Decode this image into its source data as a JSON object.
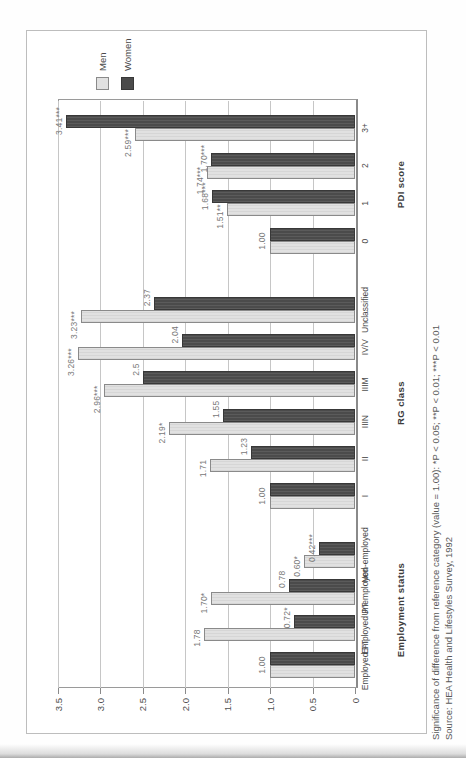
{
  "chart_data": {
    "type": "bar",
    "orientation": "vertical-bars",
    "page_rotation_deg": -90,
    "value_axis": {
      "min": 0,
      "max": 3.5,
      "gridline_step": 0.5,
      "ticks": [
        {
          "label": "3.5",
          "value": 3.5
        },
        {
          "label": "3.0",
          "value": 3.0
        },
        {
          "label": "2.5",
          "value": 2.5
        },
        {
          "label": "2.0",
          "value": 2.0
        },
        {
          "label": "1.5",
          "value": 1.5
        },
        {
          "label": "1.0",
          "value": 1.0
        },
        {
          "label": "0.5",
          "value": 0.5
        },
        {
          "label": "0",
          "value": 0
        }
      ]
    },
    "legend": [
      {
        "label": "Men",
        "swatch": "#e1e1e1"
      },
      {
        "label": "Women",
        "swatch": "#4b4b4b"
      }
    ],
    "legend_position": "top-right",
    "grid": true,
    "groups": [
      {
        "title": "Employment status",
        "categories": [
          {
            "label": "Employed FT",
            "men": 1.0,
            "women": 1.0,
            "shared_label": "1.00"
          },
          {
            "label": "Employed PT",
            "men": 1.78,
            "women": 0.72,
            "men_label": "1.78",
            "women_label": "0.72*"
          },
          {
            "label": "Unemployed",
            "men": 1.7,
            "women": 0.78,
            "men_label": "1.70*",
            "women_label": "0.78"
          },
          {
            "label": "Non-employed",
            "men": 0.6,
            "women": 0.42,
            "men_label": "0.60*",
            "women_label": "0.42***"
          }
        ]
      },
      {
        "title": "RG class",
        "categories": [
          {
            "label": "I",
            "men": 1.0,
            "women": 1.0,
            "shared_label": "1.00"
          },
          {
            "label": "II",
            "men": 1.71,
            "women": 1.23,
            "men_label": "1.71",
            "women_label": "1.23"
          },
          {
            "label": "IIIN",
            "men": 2.19,
            "women": 1.55,
            "men_label": "2.19*",
            "women_label": "1.55"
          },
          {
            "label": "IIIM",
            "men": 2.96,
            "women": 2.5,
            "men_label": "2.96***",
            "women_label": "2.5"
          },
          {
            "label": "IV/V",
            "men": 3.26,
            "women": 2.04,
            "men_label": "3.26***",
            "women_label": "2.04"
          },
          {
            "label": "Unclassified",
            "men": 3.23,
            "women": 2.37,
            "men_label": "3.23***",
            "women_label": "2.37"
          }
        ]
      },
      {
        "title": "PDI score",
        "categories": [
          {
            "label": "0",
            "men": 1.0,
            "women": 1.0,
            "shared_label": "1.00"
          },
          {
            "label": "1",
            "men": 1.51,
            "women": 1.68,
            "men_label": "1.51**",
            "women_label": "1.68***"
          },
          {
            "label": "2",
            "men": 1.74,
            "women": 1.7,
            "men_label": "1.74***",
            "women_label": "1.70***"
          },
          {
            "label": "3+",
            "men": 2.59,
            "women": 3.41,
            "men_label": "2.59***",
            "women_label": "3.41***"
          }
        ]
      }
    ],
    "footnotes": [
      "Significance of difference from reference category (value = 1.00): *P < 0.05; **P < 0.01; ***P < 0.01",
      "Source: HEA Health and Lifestyles Survey, 1992"
    ]
  },
  "colors": {
    "men_bar": "#e1e1e1",
    "men_border": "#8a8a8a",
    "women_bar": "#4b4b4b",
    "women_border": "#383838",
    "grid": "#c6c6c6",
    "plot_border": "#9a9a9a",
    "frame_border": "#bdbdbd",
    "text": "#4a4a4a",
    "value_text": "#787878",
    "footnote_text": "#585858"
  }
}
